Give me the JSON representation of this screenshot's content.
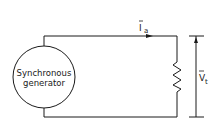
{
  "diagram": {
    "generator": {
      "line1": "Synchronous",
      "line2": "generator"
    },
    "current_label": {
      "symbol": "I",
      "subscript": "a"
    },
    "voltage_label": {
      "symbol": "V",
      "subscript": "t"
    },
    "colors": {
      "stroke": "#1a1a1a",
      "background": "#ffffff"
    }
  }
}
